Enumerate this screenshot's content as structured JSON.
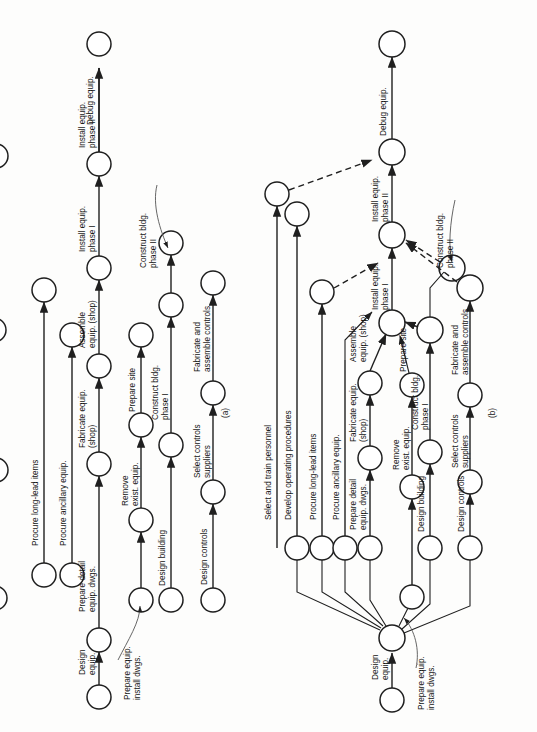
{
  "page": {
    "orientation": "rotated-90-ccw",
    "background": "#fdfdfc",
    "ink": "#1f1f1f"
  },
  "figures": [
    {
      "id": "a",
      "caption": "(a)"
    },
    {
      "id": "b",
      "caption": "(b)"
    }
  ],
  "labels": {
    "design_equip": "Design\nequip.",
    "prepare_equip_install_dwgs": "Prepare equip.\ninstall dwgs.",
    "prepare_detail_equip_dwgs": "Prepare detail\nequip. dwgs.",
    "procure_long_lead_items": "Procure long-lead items",
    "procure_ancillary_equip": "Procure ancillary equip.",
    "fabricate_equip_shop": "Fabricate equip.\n(shop)",
    "assemble_equip_shop": "Assemble\nequip. (shop)",
    "install_equip_phase_i": "Install equip.\nphase I",
    "install_equip_phase_ii": "Install equip.\nphase II",
    "debug_equip": "Debug equip.",
    "remove_exist_equip": "Remove\nexist. equip.",
    "prepare_site": "Prepare site",
    "design_building": "Design building",
    "construct_bldg_phase_i": "Construct bldg.\nphase I",
    "construct_bldg_phase_ii": "Construct bldg.\nphase II",
    "design_controls": "Design controls",
    "select_controls_suppliers": "Select controls\nsuppliers",
    "fabricate_assemble_controls": "Fabricate and\nassemble controls",
    "select_train_personnel": "Select and train personnel",
    "develop_operating_procedures": "Develop operating procedures"
  },
  "figure_a": {
    "caption": "(a)",
    "activities": [
      "Design equip.",
      "Prepare equip. install dwgs.",
      "Prepare detail equip. dwgs.",
      "Procure long-lead items",
      "Procure ancillary equip.",
      "Fabricate equip. (shop)",
      "Assemble equip. (shop)",
      "Install equip. phase I",
      "Install equip. phase II",
      "Debug equip.",
      "Remove exist. equip.",
      "Prepare site",
      "Design building",
      "Construct bldg. phase I",
      "Construct bldg. phase II",
      "Design controls",
      "Select controls suppliers",
      "Fabricate and assemble controls"
    ],
    "note": "Independent activity chains drawn in parallel; no merge node."
  },
  "figure_b": {
    "caption": "(b)",
    "activities": [
      "Design equip.",
      "Prepare equip. install dwgs.",
      "Prepare detail equip. dwgs.",
      "Procure long-lead items",
      "Procure ancillary equip.",
      "Fabricate equip. (shop)",
      "Assemble equip. (shop)",
      "Install equip. phase I",
      "Install equip. phase II",
      "Debug equip.",
      "Remove exist. equip.",
      "Prepare site",
      "Design building",
      "Construct bldg. phase I",
      "Construct bldg. phase II",
      "Design controls",
      "Select controls suppliers",
      "Fabricate and assemble controls",
      "Select and train personnel",
      "Develop operating procedures"
    ],
    "note": "Chains fan out from a single common node and merge with dummy (dashed) activities."
  }
}
